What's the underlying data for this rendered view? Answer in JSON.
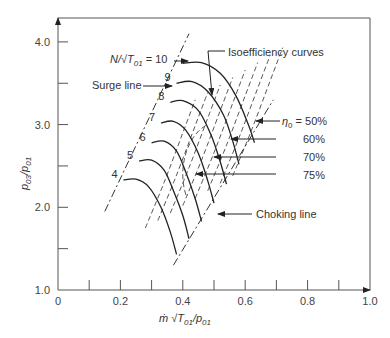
{
  "chart_data": {
    "type": "line",
    "title": "",
    "xlabel": "ṁ √T01/p01",
    "ylabel": "p03/p01",
    "xlim": [
      0,
      1.0
    ],
    "ylim": [
      1.0,
      4.2
    ],
    "x_ticks": [
      "0",
      "0.2",
      "0.4",
      "0.6",
      "0.8",
      "1.0"
    ],
    "y_ticks": [
      "1.0",
      "2.0",
      "3.0",
      "4.0"
    ],
    "grid": false,
    "speed_lines": [
      {
        "name": "4",
        "points": [
          [
            0.21,
            2.33
          ],
          [
            0.25,
            2.34
          ],
          [
            0.29,
            2.25
          ],
          [
            0.33,
            2.0
          ],
          [
            0.36,
            1.7
          ],
          [
            0.38,
            1.43
          ]
        ]
      },
      {
        "name": "5",
        "points": [
          [
            0.26,
            2.56
          ],
          [
            0.3,
            2.57
          ],
          [
            0.34,
            2.45
          ],
          [
            0.37,
            2.2
          ],
          [
            0.4,
            1.9
          ],
          [
            0.42,
            1.62
          ]
        ]
      },
      {
        "name": "6",
        "points": [
          [
            0.3,
            2.78
          ],
          [
            0.34,
            2.8
          ],
          [
            0.38,
            2.68
          ],
          [
            0.41,
            2.42
          ],
          [
            0.44,
            2.1
          ],
          [
            0.46,
            1.83
          ]
        ]
      },
      {
        "name": "7",
        "points": [
          [
            0.33,
            3.02
          ],
          [
            0.37,
            3.04
          ],
          [
            0.41,
            2.93
          ],
          [
            0.45,
            2.65
          ],
          [
            0.48,
            2.32
          ],
          [
            0.5,
            2.05
          ]
        ]
      },
      {
        "name": "8",
        "points": [
          [
            0.36,
            3.27
          ],
          [
            0.4,
            3.29
          ],
          [
            0.45,
            3.17
          ],
          [
            0.49,
            2.88
          ],
          [
            0.52,
            2.55
          ],
          [
            0.54,
            2.28
          ]
        ]
      },
      {
        "name": "9",
        "points": [
          [
            0.38,
            3.5
          ],
          [
            0.43,
            3.52
          ],
          [
            0.48,
            3.4
          ],
          [
            0.53,
            3.12
          ],
          [
            0.56,
            2.8
          ],
          [
            0.58,
            2.52
          ]
        ]
      },
      {
        "name": "10",
        "points": [
          [
            0.4,
            3.74
          ],
          [
            0.46,
            3.75
          ],
          [
            0.52,
            3.62
          ],
          [
            0.57,
            3.35
          ],
          [
            0.61,
            3.0
          ],
          [
            0.63,
            2.78
          ]
        ]
      }
    ],
    "surge_line": [
      [
        0.15,
        1.95
      ],
      [
        0.42,
        4.1
      ]
    ],
    "choking_line": [
      [
        0.37,
        1.3
      ],
      [
        0.69,
        3.3
      ]
    ],
    "isoefficiency_labels": [
      "50%",
      "60%",
      "70%",
      "75%"
    ]
  },
  "annotations": {
    "speed_param": "N/√T01 = 10",
    "surge_line": "Surge line",
    "isoefficiency": "Isoefficiency curves",
    "eta_prefix": "η0 = ",
    "eta_50": "50%",
    "eta_60": "60%",
    "eta_70": "70%",
    "eta_75": "75%",
    "choking_line": "Choking line"
  },
  "speed_labels": [
    "4",
    "5",
    "6",
    "7",
    "8",
    "9"
  ]
}
